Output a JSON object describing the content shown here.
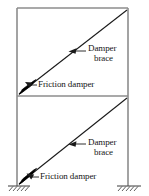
{
  "figure": {
    "type": "structural-diagram",
    "stories": 2
  },
  "labels": {
    "damper_brace_1": {
      "line1": "Damper",
      "line2": "brace"
    },
    "damper_brace_2": {
      "line1": "Damper",
      "line2": "brace"
    },
    "friction_damper_1": "Friction damper",
    "friction_damper_2": "Friction damper"
  },
  "colors": {
    "frame": "#8c8c8c",
    "brace": "#1a1a1a",
    "damper": "#000000",
    "text": "#151515",
    "background": "#ffffff",
    "ground": "#4d4d4d"
  },
  "geometry": {
    "left_column_x": 17,
    "right_column_x": 128,
    "top_beam_y": 8,
    "mid_beam_y": 96,
    "base_y": 186,
    "brace_upper": {
      "x1": 19,
      "y1": 94,
      "x2": 127,
      "y2": 10
    },
    "brace_lower": {
      "x1": 19,
      "y1": 184,
      "x2": 127,
      "y2": 98
    }
  }
}
